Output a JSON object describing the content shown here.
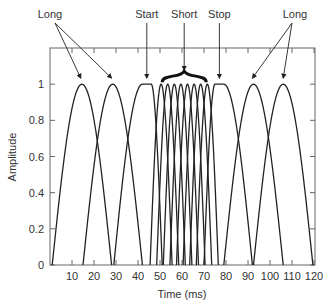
{
  "chart_data": {
    "type": "line",
    "title": "",
    "xlabel": "Time (ms)",
    "ylabel": "Amplitude",
    "xlim": [
      0,
      120
    ],
    "ylim": [
      0,
      1.2
    ],
    "x_ticks": [
      10,
      20,
      30,
      40,
      50,
      60,
      70,
      80,
      90,
      100,
      110,
      120
    ],
    "y_ticks": [
      0,
      0.2,
      0.4,
      0.6,
      0.8,
      1
    ],
    "y_tick_labels": [
      "0",
      "0.2",
      "0.4",
      "0.6",
      "0.8",
      "1"
    ],
    "grid": false,
    "series": [
      {
        "name": "Long 1",
        "start": 1,
        "end": 28,
        "peak": 14.5,
        "flat": 0
      },
      {
        "name": "Long 2",
        "start": 15,
        "end": 42,
        "peak": 28.5,
        "flat": 0
      },
      {
        "name": "Start",
        "start": 29,
        "end": 51,
        "peak": 44,
        "flat": 4
      },
      {
        "name": "Short 1",
        "start": 45.5,
        "end": 55.5,
        "peak": 50.5,
        "flat": 0
      },
      {
        "name": "Short 2",
        "start": 48.5,
        "end": 58.5,
        "peak": 53.5,
        "flat": 0
      },
      {
        "name": "Short 3",
        "start": 51.5,
        "end": 61.5,
        "peak": 56.5,
        "flat": 0
      },
      {
        "name": "Short 4",
        "start": 54.5,
        "end": 64.5,
        "peak": 59.5,
        "flat": 0
      },
      {
        "name": "Short 5",
        "start": 57.5,
        "end": 67.5,
        "peak": 62.5,
        "flat": 0
      },
      {
        "name": "Short 6",
        "start": 60.5,
        "end": 70.5,
        "peak": 65.5,
        "flat": 0
      },
      {
        "name": "Short 7",
        "start": 63.5,
        "end": 73.5,
        "peak": 68.5,
        "flat": 0
      },
      {
        "name": "Short 8",
        "start": 66.5,
        "end": 76.5,
        "peak": 71.5,
        "flat": 0
      },
      {
        "name": "Stop",
        "start": 70,
        "end": 92,
        "peak": 77,
        "flat": 4
      },
      {
        "name": "Long 3",
        "start": 79,
        "end": 106,
        "peak": 92.5,
        "flat": 0
      },
      {
        "name": "Long 4",
        "start": 92.5,
        "end": 119.5,
        "peak": 106,
        "flat": 0
      }
    ],
    "annotations": [
      {
        "label": "Long",
        "targets_ms": [
          14,
          28
        ]
      },
      {
        "label": "Start",
        "target_ms": 44
      },
      {
        "label": "Short",
        "target_ms": 61,
        "brace": [
          51,
          71
        ]
      },
      {
        "label": "Stop",
        "target_ms": 77
      },
      {
        "label": "Long",
        "targets_ms": [
          92,
          106
        ]
      }
    ]
  }
}
